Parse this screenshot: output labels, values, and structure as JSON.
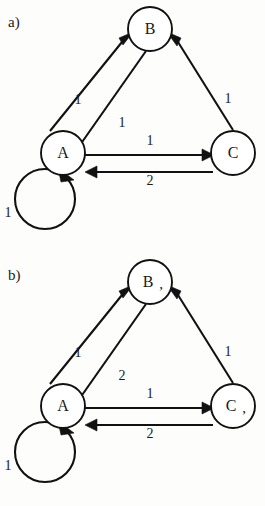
{
  "figure": {
    "background_color": "#fdfdfc",
    "ink_color": "#111111"
  },
  "panels": [
    {
      "id": "a",
      "label": "a)",
      "nodes": [
        {
          "id": "B",
          "label": "B",
          "mark": "",
          "cx": 150,
          "cy": 29,
          "r": 22
        },
        {
          "id": "A",
          "label": "A",
          "mark": "",
          "cx": 63,
          "cy": 153,
          "r": 22
        },
        {
          "id": "C",
          "label": "C",
          "mark": "",
          "cx": 233,
          "cy": 153,
          "r": 22
        }
      ],
      "edges": [
        {
          "id": "a-b",
          "from": "A",
          "to": "B",
          "weight": "1",
          "label_x": 78,
          "label_y": 101,
          "kind": "diagonal-left-outer"
        },
        {
          "id": "b-a",
          "from": "B",
          "to": "A",
          "weight": "1",
          "label_x": 122,
          "label_y": 124,
          "kind": "diagonal-left-inner"
        },
        {
          "id": "c-b",
          "from": "C",
          "to": "B",
          "weight": "1",
          "label_x": 228,
          "label_y": 100,
          "kind": "diagonal-right"
        },
        {
          "id": "a-c",
          "from": "A",
          "to": "C",
          "weight": "1",
          "label_x": 150,
          "label_y": 142,
          "kind": "horizontal-top"
        },
        {
          "id": "c-a",
          "from": "C",
          "to": "A",
          "weight": "2",
          "label_x": 150,
          "label_y": 182,
          "kind": "horizontal-bottom"
        },
        {
          "id": "a-a",
          "from": "A",
          "to": "A",
          "weight": "1",
          "label_x": 8,
          "label_y": 214,
          "kind": "self-loop"
        }
      ]
    },
    {
      "id": "b",
      "label": "b)",
      "nodes": [
        {
          "id": "B",
          "label": "B",
          "mark": ",",
          "cx": 150,
          "cy": 29,
          "r": 22
        },
        {
          "id": "A",
          "label": "A",
          "mark": "",
          "cx": 63,
          "cy": 153,
          "r": 22
        },
        {
          "id": "C",
          "label": "C",
          "mark": ",",
          "cx": 233,
          "cy": 153,
          "r": 22
        }
      ],
      "edges": [
        {
          "id": "a-b",
          "from": "A",
          "to": "B",
          "weight": "1",
          "label_x": 78,
          "label_y": 101,
          "kind": "diagonal-left-outer"
        },
        {
          "id": "b-a",
          "from": "B",
          "to": "A",
          "weight": "2",
          "label_x": 122,
          "label_y": 124,
          "kind": "diagonal-left-inner"
        },
        {
          "id": "c-b",
          "from": "C",
          "to": "B",
          "weight": "1",
          "label_x": 228,
          "label_y": 100,
          "kind": "diagonal-right"
        },
        {
          "id": "a-c",
          "from": "A",
          "to": "C",
          "weight": "1",
          "label_x": 150,
          "label_y": 142,
          "kind": "horizontal-top"
        },
        {
          "id": "c-a",
          "from": "C",
          "to": "A",
          "weight": "2",
          "label_x": 150,
          "label_y": 182,
          "kind": "horizontal-bottom"
        },
        {
          "id": "a-a",
          "from": "A",
          "to": "A",
          "weight": "1",
          "label_x": 8,
          "label_y": 214,
          "kind": "self-loop"
        }
      ]
    }
  ]
}
